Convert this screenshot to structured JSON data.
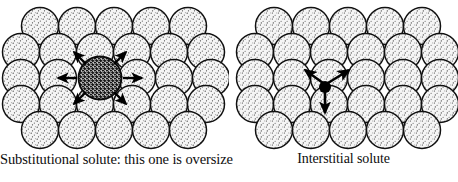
{
  "figure": {
    "background_color": "#ffffff",
    "width": 458,
    "height": 182
  },
  "panels": [
    {
      "id": "substitutional",
      "caption": "Substitutional solute: this one is oversize",
      "solute": {
        "kind": "substitutional",
        "label": "oversize-substitutional-solute",
        "fill_color": "#1a1a1a",
        "pattern": "dense-dark-stipple",
        "center_x": 100,
        "center_y": 78,
        "radius": 21.5,
        "oversize": true
      },
      "arrow_count": 6,
      "arrow_directions": [
        "up-left",
        "up-right",
        "left",
        "right",
        "down-left",
        "down-right"
      ],
      "lattice": {
        "rows": [
          5,
          6,
          6,
          6,
          5
        ],
        "circle_radius": 18.5,
        "fill_color": "#f2f2f2",
        "stroke_color": "#111111",
        "pattern": "light-stipple"
      }
    },
    {
      "id": "interstitial",
      "caption": "Interstitial solute",
      "solute": {
        "kind": "interstitial",
        "label": "interstitial-solute",
        "fill_color": "#000000",
        "pattern": "solid",
        "center_x": 96,
        "center_y": 87,
        "radius": 6,
        "oversize": false
      },
      "arrow_count": 3,
      "arrow_directions": [
        "up-left",
        "up-right",
        "down"
      ],
      "lattice": {
        "rows": [
          5,
          6,
          6,
          6,
          5
        ],
        "circle_radius": 18.5,
        "fill_color": "#f2f2f2",
        "stroke_color": "#111111",
        "pattern": "light-stipple"
      }
    }
  ],
  "colors": {
    "matrix_atom_fill": "#f2f2f2",
    "matrix_atom_stroke": "#111111",
    "solute_dark": "#1a1a1a",
    "interstitial_dot": "#000000",
    "text": "#0d0d0d"
  }
}
